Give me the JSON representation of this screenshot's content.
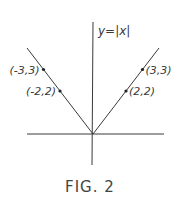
{
  "chart_data": {
    "type": "line",
    "title": "y=|x|",
    "caption": "FIG. 2",
    "xlabel": "",
    "ylabel": "",
    "function": "y = |x|",
    "series": [
      {
        "name": "y=|x|",
        "x": [
          -4,
          0,
          4
        ],
        "y": [
          4,
          0,
          4
        ]
      }
    ],
    "points": [
      {
        "x": -3,
        "y": 3,
        "label": "(-3,3)"
      },
      {
        "x": -2,
        "y": 2,
        "label": "(-2,2)"
      },
      {
        "x": 2,
        "y": 2,
        "label": "(2,2)"
      },
      {
        "x": 3,
        "y": 3,
        "label": "(3,3)"
      }
    ],
    "grid": false,
    "legend": "none"
  }
}
